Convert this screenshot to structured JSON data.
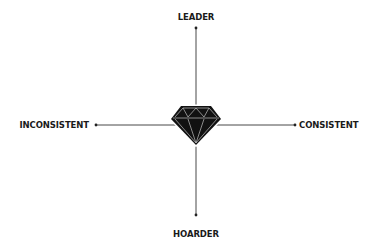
{
  "diagram": {
    "type": "quadrant-axes",
    "center_icon": "diamond-icon",
    "axes": {
      "vertical": {
        "top_label": "LEADER",
        "bottom_label": "HOARDER"
      },
      "horizontal": {
        "left_label": "INCONSISTENT",
        "right_label": "CONSISTENT"
      }
    },
    "colors": {
      "background": "#ffffff",
      "line": "#333333",
      "diamond_fill": "#111111",
      "diamond_facets": "#bfbfbf",
      "text": "#1a1a1a"
    }
  }
}
